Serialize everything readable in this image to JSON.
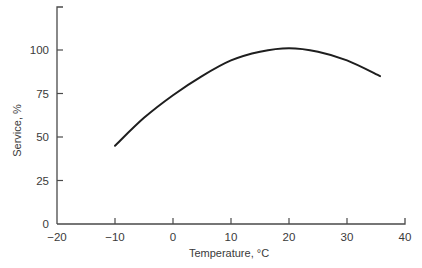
{
  "chart_data": {
    "type": "line",
    "title": "",
    "xlabel": "Temperature, °C",
    "ylabel": "Service, %",
    "xlim": [
      -20,
      40
    ],
    "ylim": [
      0,
      125
    ],
    "xticks": [
      -20,
      -10,
      0,
      10,
      20,
      30,
      40
    ],
    "xtick_labels": [
      "−20",
      "−10",
      "0",
      "10",
      "20",
      "30",
      "40"
    ],
    "yticks": [
      0,
      25,
      50,
      75,
      100
    ],
    "ytick_labels": [
      "0",
      "25",
      "50",
      "75",
      "100"
    ],
    "grid": false,
    "legend": "none",
    "series": [
      {
        "name": "Service",
        "x": [
          -10,
          -5,
          0,
          5,
          10,
          15,
          20,
          25,
          30,
          35.7
        ],
        "y": [
          45,
          61,
          74,
          85,
          94,
          99,
          101,
          99,
          94,
          85
        ]
      }
    ]
  }
}
